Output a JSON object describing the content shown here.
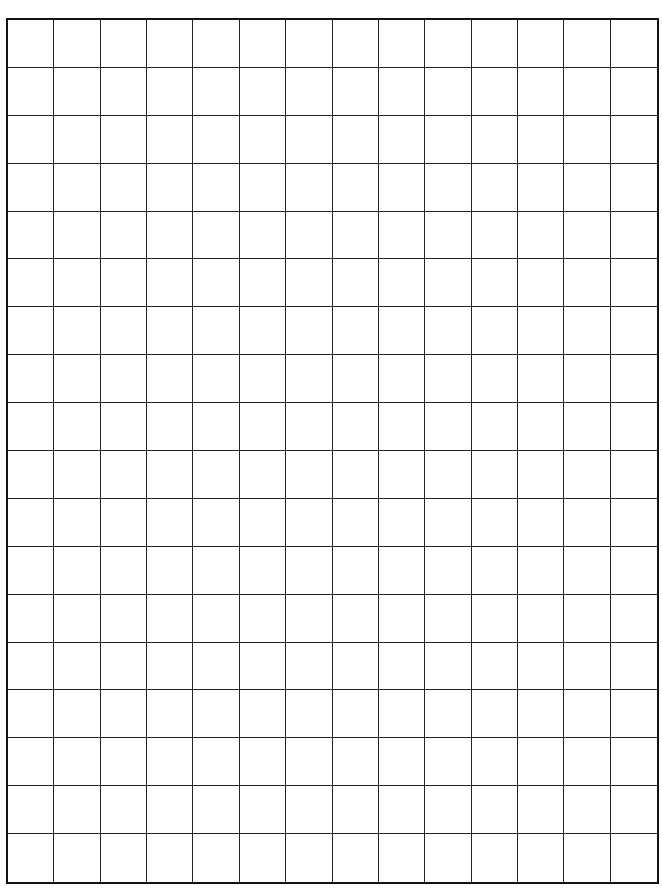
{
  "grid": {
    "columns": 14,
    "rows": 18,
    "line_color": "#222222",
    "border_color": "#111111",
    "background": "#ffffff"
  }
}
